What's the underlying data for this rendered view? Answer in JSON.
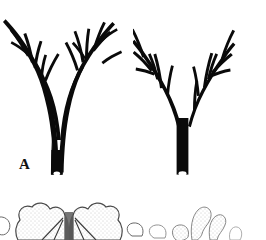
{
  "plate": {
    "width": 266,
    "height": 240,
    "background_color": "#ffffff",
    "ink_color": "#0a0a0a",
    "type": "scientific-specimen-plate",
    "description": "Two silhouetted branching specimens labeled A and B above a partially visible row of stippled line-drawings"
  },
  "panels": [
    {
      "id": "a",
      "label": "A",
      "name": "specimen-a",
      "form": "two-stemmed crossing branched specimen with slender tapering branch tips",
      "stem_tip": "cut-stem-oval-white",
      "branch_count": 11
    },
    {
      "id": "b",
      "label": "B",
      "name": "specimen-b",
      "form": "single thick stem forking into a wide V with outward-spreading branches",
      "stem_tip": "cut-stem-oval-white",
      "branch_count": 9
    }
  ],
  "bottom_strip": {
    "name": "cropped-figure-row",
    "description": "Partially cropped stippled outline drawings along the lower edge",
    "figures": [
      {
        "id": "left",
        "name": "bilobed-stippled-structure",
        "description": "Pair of rounded stippled lobes flanking a dark central midrib, with small circular outlines at each side"
      },
      {
        "id": "right",
        "name": "club-shaped-stippled-structure",
        "description": "Faint club- and loop-shaped stippled outlines"
      }
    ]
  }
}
